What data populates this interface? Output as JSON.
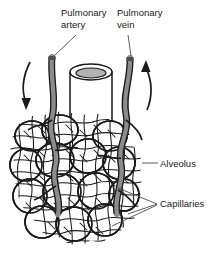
{
  "figure": {
    "background_color": "#ffffff",
    "ink_color": "#1a1a1a",
    "vessel_fill_color": "#8c8c8c",
    "lumen_fill_color": "#b3b3b3"
  },
  "labels": {
    "pulmonary_artery": {
      "line1": "Pulmonary",
      "line2": "artery"
    },
    "pulmonary_vein": {
      "line1": "Pulmonary",
      "line2": "vein"
    },
    "alveolus": "Alveolus",
    "capillaries": "Capillaries"
  },
  "flow_arrows": [
    {
      "name": "artery-inflow-arrow",
      "direction": "down",
      "meaning": "deoxygenated blood flowing in"
    },
    {
      "name": "vein-outflow-arrow",
      "direction": "up",
      "meaning": "oxygenated blood flowing out"
    }
  ],
  "structures": [
    "bronchiole",
    "pulmonary artery",
    "pulmonary vein",
    "alveolar sacs",
    "capillary network"
  ]
}
